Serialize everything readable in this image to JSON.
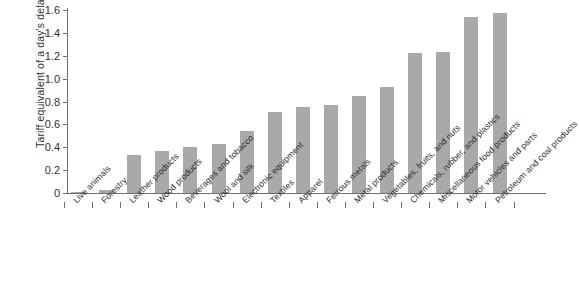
{
  "chart_data": {
    "type": "bar",
    "title": "",
    "subtitle": "",
    "xlabel": "",
    "ylabel": "Tariff equivalent of a day's delay (%)",
    "ylim": [
      0,
      1.6
    ],
    "ytick_labels": [
      "0",
      "0.2",
      "0.4",
      "0.6",
      "0.8",
      "1.0",
      "1.2",
      "1.4",
      "1.6"
    ],
    "ytick_values": [
      0,
      0.2,
      0.4,
      0.6,
      0.8,
      1.0,
      1.2,
      1.4,
      1.6
    ],
    "grid": false,
    "legend": null,
    "bar_color": "#a9a9a9",
    "axis_color": "#6f6f6f",
    "categories": [
      "Live animals",
      "Forestry",
      "Leather products",
      "Wood products",
      "Beverages and tobacco",
      "Wool and silk",
      "Electronic equipment",
      "Textiles",
      "Apparel",
      "Ferrous metals",
      "Metal products",
      "Vegetables, fruits, and nuts",
      "Chemicals, rubber, and plastics",
      "Miscellaneous food products",
      "Motor vehicles and parts",
      "Petroleum and coal products"
    ],
    "values": [
      0.01,
      0.03,
      0.33,
      0.37,
      0.4,
      0.43,
      0.54,
      0.71,
      0.75,
      0.77,
      0.85,
      0.93,
      1.22,
      1.23,
      1.54,
      1.57
    ]
  }
}
